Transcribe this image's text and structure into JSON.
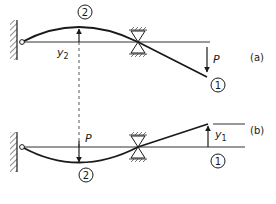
{
  "figure": {
    "panel_a": {
      "label": "(a)",
      "load_label": "P",
      "deflection_label": "y",
      "deflection_subscript": "2",
      "point_1_label": "1",
      "point_2_label": "2"
    },
    "panel_b": {
      "label": "(b)",
      "load_label": "P",
      "deflection_label": "y",
      "deflection_subscript": "1",
      "point_1_label": "1",
      "point_2_label": "2"
    }
  },
  "colors": {
    "ink": "#1a1a1a",
    "hatch": "#444444",
    "background": "#ffffff"
  }
}
